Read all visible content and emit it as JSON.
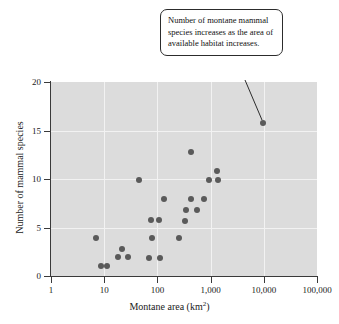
{
  "figure": {
    "annotation": {
      "text": "Number of montane mammal species increases as the area of available habitat increases."
    }
  },
  "chart_data": {
    "type": "scatter",
    "title": "",
    "xlabel": "Montane area (km",
    "xlabel_sup": "2",
    "xlabel_tail": ")",
    "ylabel": "Number of mammal species",
    "xscale": "log",
    "yscale": "linear",
    "xlim": [
      1,
      100000
    ],
    "ylim": [
      0,
      20
    ],
    "grid": true,
    "legend": "none",
    "xticks": [
      1,
      10,
      100,
      1000,
      10000,
      100000
    ],
    "xticklabels": [
      "1",
      "10",
      "100",
      "1,000",
      "10,000",
      "100,000"
    ],
    "yticks": [
      0,
      5,
      10,
      15,
      20
    ],
    "yticklabels": [
      "0",
      "5",
      "10",
      "15",
      "20"
    ],
    "marker": {
      "shape": "circle",
      "color": "#5a5a5a",
      "size_px": 6
    },
    "plot_background": "#dcdcdc",
    "gridline_color": "#f2f2f2",
    "axis_color": "#3a3a3a",
    "points": [
      {
        "x": 7,
        "y": 3.9
      },
      {
        "x": 8.6,
        "y": 1.0
      },
      {
        "x": 11.5,
        "y": 1.0
      },
      {
        "x": 18,
        "y": 2.0
      },
      {
        "x": 22,
        "y": 2.8
      },
      {
        "x": 28,
        "y": 2.0
      },
      {
        "x": 46,
        "y": 9.9
      },
      {
        "x": 70,
        "y": 1.9
      },
      {
        "x": 75,
        "y": 5.8
      },
      {
        "x": 78,
        "y": 3.9
      },
      {
        "x": 105,
        "y": 5.8
      },
      {
        "x": 112,
        "y": 1.9
      },
      {
        "x": 135,
        "y": 7.9
      },
      {
        "x": 260,
        "y": 3.9
      },
      {
        "x": 330,
        "y": 5.7
      },
      {
        "x": 350,
        "y": 6.8
      },
      {
        "x": 420,
        "y": 7.9
      },
      {
        "x": 430,
        "y": 12.8
      },
      {
        "x": 560,
        "y": 6.8
      },
      {
        "x": 760,
        "y": 7.9
      },
      {
        "x": 950,
        "y": 9.9
      },
      {
        "x": 1300,
        "y": 10.8
      },
      {
        "x": 1400,
        "y": 9.9
      },
      {
        "x": 9500,
        "y": 15.8
      }
    ],
    "annotations": [
      {
        "text": "Number of montane mammal species increases as the area of available habitat increases.",
        "points_to": {
          "x": 9500,
          "y": 15.8
        }
      }
    ]
  }
}
